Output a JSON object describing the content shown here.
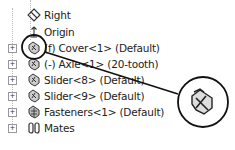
{
  "tree": {
    "items": [
      {
        "label": "Right",
        "icon": "plane-icon",
        "expandable": false
      },
      {
        "label": "Origin",
        "icon": "origin-icon",
        "expandable": false
      },
      {
        "label": "(f) Cover<1> (Default)",
        "icon": "part-icon",
        "expandable": true
      },
      {
        "label": "(-) Axle<1> (20-tooth)",
        "icon": "part-icon",
        "expandable": true
      },
      {
        "label": "Slider<8> (Default)",
        "icon": "part-icon",
        "expandable": true
      },
      {
        "label": "Slider<9> (Default)",
        "icon": "part-icon",
        "expandable": true
      },
      {
        "label": "Fasteners<1> (Default)",
        "icon": "subassembly-icon",
        "expandable": true
      },
      {
        "label": "Mates",
        "icon": "mates-icon",
        "expandable": true
      }
    ],
    "expand_glyph": "+"
  },
  "callout": {
    "target": "(f) Cover<1> (Default)",
    "magnified_icon": "fixed-part-icon"
  }
}
